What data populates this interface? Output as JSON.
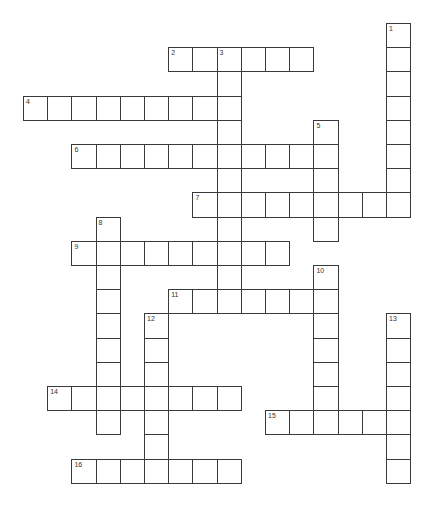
{
  "puzzle": {
    "grid": {
      "origin_x": 23,
      "origin_y": 23,
      "cell_size": 24.2
    },
    "across": [
      {
        "number": "2",
        "row": 1,
        "col": 6,
        "length": 6
      },
      {
        "number": "4",
        "row": 3,
        "col": 0,
        "length": 9
      },
      {
        "number": "6",
        "row": 5,
        "col": 2,
        "length": 11
      },
      {
        "number": "7",
        "row": 7,
        "col": 7,
        "length": 9
      },
      {
        "number": "9",
        "row": 9,
        "col": 2,
        "length": 9
      },
      {
        "number": "11",
        "row": 11,
        "col": 6,
        "length": 7
      },
      {
        "number": "14",
        "row": 15,
        "col": 1,
        "length": 8
      },
      {
        "number": "15",
        "row": 16,
        "col": 10,
        "length": 6
      },
      {
        "number": "16",
        "row": 18,
        "col": 2,
        "length": 7
      }
    ],
    "down": [
      {
        "number": "1",
        "row": 0,
        "col": 15,
        "length": 8
      },
      {
        "number": "3",
        "row": 1,
        "col": 8,
        "length": 11
      },
      {
        "number": "5",
        "row": 4,
        "col": 12,
        "length": 5
      },
      {
        "number": "8",
        "row": 8,
        "col": 3,
        "length": 9
      },
      {
        "number": "10",
        "row": 10,
        "col": 12,
        "length": 7
      },
      {
        "number": "12",
        "row": 12,
        "col": 5,
        "length": 7
      },
      {
        "number": "13",
        "row": 12,
        "col": 15,
        "length": 7
      }
    ]
  }
}
